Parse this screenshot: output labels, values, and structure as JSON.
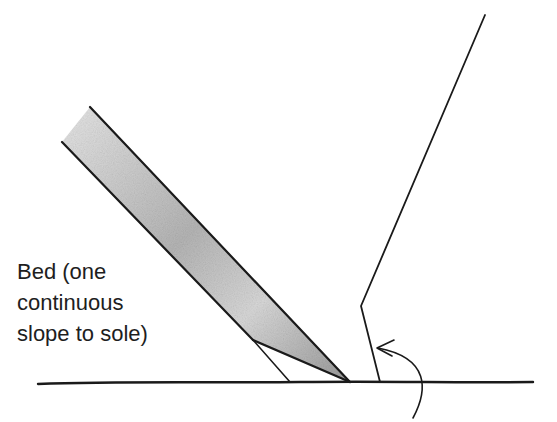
{
  "diagram": {
    "label_lines": [
      "Bed (one",
      "continuous",
      "slope to sole)"
    ],
    "colors": {
      "ink": "#1a1a1a",
      "blade_shade_light": "#e8e8e8",
      "blade_shade_dark": "#9a9a9a",
      "background": "#ffffff"
    },
    "elements": {
      "sole_line": {
        "from": [
          38,
          383
        ],
        "to": [
          533,
          383
        ]
      },
      "blade_upper_edge": {
        "from": [
          90,
          107
        ],
        "to": [
          350,
          382
        ]
      },
      "blade_lower_edge": {
        "from": [
          62,
          142
        ],
        "to": [
          253,
          340
        ]
      },
      "blade_bevel": {
        "from": [
          253,
          340
        ],
        "to": [
          350,
          382
        ]
      },
      "bed_line": {
        "from": [
          253,
          340
        ],
        "to": [
          290,
          382
        ]
      },
      "wall": {
        "points": [
          [
            380,
            382
          ],
          [
            361,
            306
          ],
          [
            485,
            15
          ]
        ]
      },
      "arrow": {
        "start": [
          413,
          418
        ],
        "end": [
          377,
          348
        ]
      }
    }
  }
}
